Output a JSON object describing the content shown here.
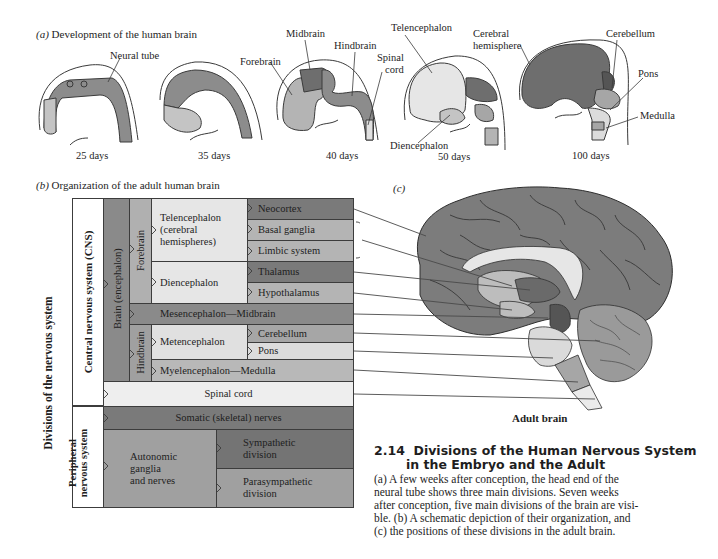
{
  "panel_a": {
    "title_letter": "(a)",
    "title": "Development of the human brain",
    "stages": [
      {
        "label": "25 days",
        "annotations": [
          "Neural tube"
        ]
      },
      {
        "label": "35 days",
        "annotations": []
      },
      {
        "label": "40 days",
        "annotations": [
          "Forebrain",
          "Midbrain",
          "Hindbrain",
          "Spinal cord"
        ]
      },
      {
        "label": "50 days",
        "annotations": [
          "Telencephalon",
          "Diencephalon"
        ]
      },
      {
        "label": "100 days",
        "annotations": [
          "Cerebral hemisphere",
          "Cerebellum",
          "Pons",
          "Medulla"
        ]
      }
    ],
    "labels": {
      "neural_tube": "Neural tube",
      "forebrain": "Forebrain",
      "midbrain": "Midbrain",
      "hindbrain": "Hindbrain",
      "spinal": "Spinal",
      "cord": "cord",
      "telencephalon": "Telencephalon",
      "diencephalon": "Diencephalon",
      "cerebral": "Cerebral",
      "hemisphere": "hemisphere",
      "cerebellum": "Cerebellum",
      "pons": "Pons",
      "medulla": "Medulla",
      "d25": "25 days",
      "d35": "35 days",
      "d40": "40 days",
      "d50": "50 days",
      "d100": "100 days"
    }
  },
  "panel_b": {
    "title_letter": "(b)",
    "title": "Organization of the adult human brain",
    "outer_label": "Divisions of the nervous system",
    "cns_label": "Central nervous system (CNS)",
    "pns_label_1": "Peripheral",
    "pns_label_2": "nervous system",
    "brain_label": "Brain (encephalon)",
    "forebrain_label": "Forebrain",
    "hindbrain_label": "Hindbrain",
    "telencephalon_1": "Telencephalon",
    "telencephalon_2": "(cerebral",
    "telencephalon_3": "hemispheres)",
    "diencephalon": "Diencephalon",
    "neocortex": "Neocortex",
    "basal_ganglia": "Basal ganglia",
    "limbic_system": "Limbic system",
    "thalamus": "Thalamus",
    "hypothalamus": "Hypothalamus",
    "mesencephalon": "Mesencephalon—Midbrain",
    "metencephalon": "Metencephalon",
    "cerebellum": "Cerebellum",
    "pons": "Pons",
    "myelencephalon": "Myelencephalon—Medulla",
    "spinal_cord": "Spinal cord",
    "somatic": "Somatic (skeletal) nerves",
    "autonomic_1": "Autonomic",
    "autonomic_2": "ganglia",
    "autonomic_3": "and nerves",
    "sympathetic_1": "Sympathetic",
    "sympathetic_2": "division",
    "parasympathetic_1": "Parasympathetic",
    "parasympathetic_2": "division"
  },
  "panel_c": {
    "title_letter": "(c)",
    "caption": "Adult brain"
  },
  "figure_caption": {
    "number": "2.14",
    "title_line_1": "Divisions of the Human Nervous System",
    "title_line_2": "in the Embryo and the Adult",
    "body_lines": [
      "(a) A few weeks after conception, the head end of the",
      "neural tube shows three main divisions. Seven weeks",
      "after conception, five main divisions of the brain are visi-",
      "ble. (b) A schematic depiction of their organization, and",
      "(c) the positions of these divisions in the adult brain."
    ]
  },
  "colors": {
    "darkest": "#6e6e6e",
    "dark": "#8a8a8a",
    "mid": "#a6a6a6",
    "light": "#c8c8c8",
    "lightest": "#e6e6e6",
    "border": "#3c3c3c"
  }
}
